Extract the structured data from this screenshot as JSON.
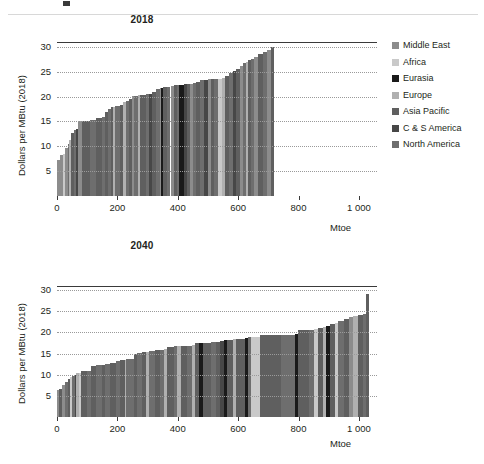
{
  "legend": {
    "position": "right",
    "items": [
      {
        "label": "Middle East",
        "color": "#8c8c8c"
      },
      {
        "label": "Africa",
        "color": "#c9c9c9"
      },
      {
        "label": "Eurasia",
        "color": "#1a1a1a"
      },
      {
        "label": "Europe",
        "color": "#b0b0b0"
      },
      {
        "label": "Asia Pacific",
        "color": "#5f5f5f"
      },
      {
        "label": "C & S America",
        "color": "#474747"
      },
      {
        "label": "North America",
        "color": "#6e6e6e"
      }
    ]
  },
  "chart_data": [
    {
      "type": "bar",
      "title": "2018",
      "xlabel": "Mtoe",
      "ylabel": "Dollars per MBtu (2018)",
      "xlim": [
        0,
        1060
      ],
      "ylim": [
        0,
        31
      ],
      "xticks": [
        0,
        200,
        400,
        600,
        800,
        1000
      ],
      "xticklabels": [
        "0",
        "200",
        "400",
        "600",
        "800",
        "1 000"
      ],
      "yticks": [
        5,
        10,
        15,
        20,
        25,
        30
      ],
      "yticklabels": [
        "5",
        "10",
        "15",
        "20",
        "25",
        "30"
      ],
      "grid": "horizontal-dotted",
      "orientation": "supply-curve-stepped",
      "bars": [
        {
          "x0": 0,
          "width": 10,
          "value": 7.2,
          "region": "Middle East"
        },
        {
          "x0": 10,
          "width": 9,
          "value": 8.3,
          "region": "Middle East"
        },
        {
          "x0": 19,
          "width": 7,
          "value": 8.5,
          "region": "Africa"
        },
        {
          "x0": 26,
          "width": 9,
          "value": 9.7,
          "region": "Middle East"
        },
        {
          "x0": 35,
          "width": 6,
          "value": 10.4,
          "region": "North America"
        },
        {
          "x0": 41,
          "width": 7,
          "value": 11.3,
          "region": "Europe"
        },
        {
          "x0": 48,
          "width": 8,
          "value": 12.6,
          "region": "Asia Pacific"
        },
        {
          "x0": 56,
          "width": 7,
          "value": 13.3,
          "region": "North America"
        },
        {
          "x0": 63,
          "width": 6,
          "value": 13.5,
          "region": "C & S America"
        },
        {
          "x0": 69,
          "width": 13,
          "value": 15.0,
          "region": "Middle East"
        },
        {
          "x0": 82,
          "width": 26,
          "value": 15.2,
          "region": "Asia Pacific"
        },
        {
          "x0": 108,
          "width": 22,
          "value": 15.4,
          "region": "North America"
        },
        {
          "x0": 130,
          "width": 20,
          "value": 15.7,
          "region": "Asia Pacific"
        },
        {
          "x0": 150,
          "width": 10,
          "value": 16.0,
          "region": "North America"
        },
        {
          "x0": 160,
          "width": 9,
          "value": 16.9,
          "region": "Asia Pacific"
        },
        {
          "x0": 169,
          "width": 10,
          "value": 17.6,
          "region": "North America"
        },
        {
          "x0": 179,
          "width": 8,
          "value": 17.9,
          "region": "Asia Pacific"
        },
        {
          "x0": 187,
          "width": 5,
          "value": 18.0,
          "region": "Europe"
        },
        {
          "x0": 192,
          "width": 16,
          "value": 18.1,
          "region": "North America"
        },
        {
          "x0": 208,
          "width": 10,
          "value": 18.3,
          "region": "Asia Pacific"
        },
        {
          "x0": 218,
          "width": 12,
          "value": 18.9,
          "region": "Europe"
        },
        {
          "x0": 230,
          "width": 10,
          "value": 19.2,
          "region": "North America"
        },
        {
          "x0": 240,
          "width": 8,
          "value": 19.6,
          "region": "Asia Pacific"
        },
        {
          "x0": 248,
          "width": 8,
          "value": 20.1,
          "region": "Middle East"
        },
        {
          "x0": 256,
          "width": 12,
          "value": 20.2,
          "region": "North America"
        },
        {
          "x0": 268,
          "width": 6,
          "value": 20.3,
          "region": "Europe"
        },
        {
          "x0": 274,
          "width": 20,
          "value": 20.4,
          "region": "Asia Pacific"
        },
        {
          "x0": 294,
          "width": 12,
          "value": 20.5,
          "region": "North America"
        },
        {
          "x0": 306,
          "width": 10,
          "value": 20.6,
          "region": "C & S America"
        },
        {
          "x0": 316,
          "width": 12,
          "value": 21.0,
          "region": "Asia Pacific"
        },
        {
          "x0": 328,
          "width": 12,
          "value": 21.5,
          "region": "North America"
        },
        {
          "x0": 340,
          "width": 5,
          "value": 21.7,
          "region": "Middle East"
        },
        {
          "x0": 345,
          "width": 5,
          "value": 21.8,
          "region": "Eurasia"
        },
        {
          "x0": 350,
          "width": 14,
          "value": 21.9,
          "region": "Asia Pacific"
        },
        {
          "x0": 364,
          "width": 12,
          "value": 22.0,
          "region": "North America"
        },
        {
          "x0": 376,
          "width": 10,
          "value": 22.1,
          "region": "Middle East"
        },
        {
          "x0": 386,
          "width": 10,
          "value": 22.3,
          "region": "Asia Pacific"
        },
        {
          "x0": 396,
          "width": 8,
          "value": 22.4,
          "region": "North America"
        },
        {
          "x0": 404,
          "width": 16,
          "value": 22.4,
          "region": "Eurasia"
        },
        {
          "x0": 420,
          "width": 10,
          "value": 22.5,
          "region": "C & S America"
        },
        {
          "x0": 430,
          "width": 12,
          "value": 22.6,
          "region": "Asia Pacific"
        },
        {
          "x0": 442,
          "width": 10,
          "value": 22.6,
          "region": "Middle East"
        },
        {
          "x0": 452,
          "width": 10,
          "value": 22.7,
          "region": "North America"
        },
        {
          "x0": 462,
          "width": 13,
          "value": 23.0,
          "region": "Asia Pacific"
        },
        {
          "x0": 475,
          "width": 12,
          "value": 23.3,
          "region": "North America"
        },
        {
          "x0": 487,
          "width": 12,
          "value": 23.4,
          "region": "C & S America"
        },
        {
          "x0": 499,
          "width": 12,
          "value": 23.5,
          "region": "Middle East"
        },
        {
          "x0": 511,
          "width": 10,
          "value": 23.5,
          "region": "Asia Pacific"
        },
        {
          "x0": 521,
          "width": 12,
          "value": 23.6,
          "region": "North America"
        },
        {
          "x0": 533,
          "width": 14,
          "value": 23.6,
          "region": "Africa"
        },
        {
          "x0": 547,
          "width": 10,
          "value": 23.7,
          "region": "Europe"
        },
        {
          "x0": 557,
          "width": 14,
          "value": 24.1,
          "region": "Asia Pacific"
        },
        {
          "x0": 571,
          "width": 12,
          "value": 24.7,
          "region": "North America"
        },
        {
          "x0": 583,
          "width": 10,
          "value": 25.1,
          "region": "C & S America"
        },
        {
          "x0": 593,
          "width": 12,
          "value": 25.6,
          "region": "Asia Pacific"
        },
        {
          "x0": 605,
          "width": 10,
          "value": 26.2,
          "region": "Middle East"
        },
        {
          "x0": 615,
          "width": 10,
          "value": 26.7,
          "region": "North America"
        },
        {
          "x0": 625,
          "width": 8,
          "value": 27.0,
          "region": "Europe"
        },
        {
          "x0": 633,
          "width": 10,
          "value": 27.3,
          "region": "Asia Pacific"
        },
        {
          "x0": 643,
          "width": 10,
          "value": 27.6,
          "region": "North America"
        },
        {
          "x0": 653,
          "width": 14,
          "value": 28.0,
          "region": "Middle East"
        },
        {
          "x0": 667,
          "width": 14,
          "value": 28.5,
          "region": "Asia Pacific"
        },
        {
          "x0": 681,
          "width": 14,
          "value": 29.0,
          "region": "North America"
        },
        {
          "x0": 695,
          "width": 14,
          "value": 29.3,
          "region": "Middle East"
        },
        {
          "x0": 709,
          "width": 11,
          "value": 29.9,
          "region": "Asia Pacific"
        }
      ]
    },
    {
      "type": "bar",
      "title": "2040",
      "xlabel": "Mtoe",
      "ylabel": "Dollars per MBtu (2018)",
      "xlim": [
        0,
        1060
      ],
      "ylim": [
        0,
        31
      ],
      "xticks": [
        0,
        200,
        400,
        600,
        800,
        1000
      ],
      "xticklabels": [
        "0",
        "200",
        "400",
        "600",
        "800",
        "1 000"
      ],
      "yticks": [
        5,
        10,
        15,
        20,
        25,
        30
      ],
      "yticklabels": [
        "5",
        "10",
        "15",
        "20",
        "25",
        "30"
      ],
      "grid": "horizontal-dotted",
      "orientation": "supply-curve-stepped",
      "bars": [
        {
          "x0": 0,
          "width": 8,
          "value": 6.3,
          "region": "Middle East"
        },
        {
          "x0": 8,
          "width": 10,
          "value": 6.7,
          "region": "Asia Pacific"
        },
        {
          "x0": 18,
          "width": 10,
          "value": 7.6,
          "region": "Middle East"
        },
        {
          "x0": 28,
          "width": 8,
          "value": 8.3,
          "region": "North America"
        },
        {
          "x0": 36,
          "width": 8,
          "value": 8.9,
          "region": "Asia Pacific"
        },
        {
          "x0": 44,
          "width": 6,
          "value": 9.4,
          "region": "Africa"
        },
        {
          "x0": 50,
          "width": 8,
          "value": 9.8,
          "region": "North America"
        },
        {
          "x0": 58,
          "width": 6,
          "value": 10.0,
          "region": "C & S America"
        },
        {
          "x0": 64,
          "width": 8,
          "value": 10.3,
          "region": "Europe"
        },
        {
          "x0": 72,
          "width": 6,
          "value": 10.5,
          "region": "Africa"
        },
        {
          "x0": 78,
          "width": 20,
          "value": 10.9,
          "region": "Asia Pacific"
        },
        {
          "x0": 98,
          "width": 14,
          "value": 11.0,
          "region": "North America"
        },
        {
          "x0": 112,
          "width": 18,
          "value": 12.1,
          "region": "Asia Pacific"
        },
        {
          "x0": 130,
          "width": 18,
          "value": 12.3,
          "region": "North America"
        },
        {
          "x0": 148,
          "width": 10,
          "value": 12.4,
          "region": "Asia Pacific"
        },
        {
          "x0": 158,
          "width": 16,
          "value": 12.5,
          "region": "North America"
        },
        {
          "x0": 174,
          "width": 20,
          "value": 12.7,
          "region": "Asia Pacific"
        },
        {
          "x0": 194,
          "width": 14,
          "value": 13.3,
          "region": "North America"
        },
        {
          "x0": 208,
          "width": 16,
          "value": 13.5,
          "region": "Asia Pacific"
        },
        {
          "x0": 224,
          "width": 6,
          "value": 13.6,
          "region": "Europe"
        },
        {
          "x0": 230,
          "width": 24,
          "value": 13.8,
          "region": "North America"
        },
        {
          "x0": 254,
          "width": 10,
          "value": 14.9,
          "region": "Asia Pacific"
        },
        {
          "x0": 264,
          "width": 16,
          "value": 15.1,
          "region": "North America"
        },
        {
          "x0": 280,
          "width": 14,
          "value": 15.3,
          "region": "Asia Pacific"
        },
        {
          "x0": 294,
          "width": 10,
          "value": 15.4,
          "region": "Europe"
        },
        {
          "x0": 304,
          "width": 20,
          "value": 15.7,
          "region": "North America"
        },
        {
          "x0": 324,
          "width": 18,
          "value": 15.8,
          "region": "Asia Pacific"
        },
        {
          "x0": 342,
          "width": 14,
          "value": 15.9,
          "region": "North America"
        },
        {
          "x0": 356,
          "width": 10,
          "value": 16.0,
          "region": "Europe"
        },
        {
          "x0": 366,
          "width": 22,
          "value": 16.6,
          "region": "Asia Pacific"
        },
        {
          "x0": 388,
          "width": 10,
          "value": 16.7,
          "region": "North America"
        },
        {
          "x0": 398,
          "width": 12,
          "value": 16.7,
          "region": "Europe"
        },
        {
          "x0": 410,
          "width": 20,
          "value": 16.8,
          "region": "Asia Pacific"
        },
        {
          "x0": 430,
          "width": 16,
          "value": 16.9,
          "region": "North America"
        },
        {
          "x0": 446,
          "width": 12,
          "value": 17.0,
          "region": "Europe"
        },
        {
          "x0": 458,
          "width": 14,
          "value": 17.4,
          "region": "Asia Pacific"
        },
        {
          "x0": 472,
          "width": 10,
          "value": 17.5,
          "region": "Eurasia"
        },
        {
          "x0": 482,
          "width": 28,
          "value": 17.6,
          "region": "Asia Pacific"
        },
        {
          "x0": 510,
          "width": 18,
          "value": 17.7,
          "region": "North America"
        },
        {
          "x0": 528,
          "width": 12,
          "value": 17.8,
          "region": "Asia Pacific"
        },
        {
          "x0": 540,
          "width": 12,
          "value": 17.9,
          "region": "C & S America"
        },
        {
          "x0": 552,
          "width": 12,
          "value": 18.2,
          "region": "Eurasia"
        },
        {
          "x0": 564,
          "width": 18,
          "value": 18.3,
          "region": "Asia Pacific"
        },
        {
          "x0": 582,
          "width": 10,
          "value": 18.4,
          "region": "Europe"
        },
        {
          "x0": 592,
          "width": 30,
          "value": 18.5,
          "region": "Asia Pacific"
        },
        {
          "x0": 622,
          "width": 10,
          "value": 18.6,
          "region": "Eurasia"
        },
        {
          "x0": 632,
          "width": 10,
          "value": 18.9,
          "region": "North America"
        },
        {
          "x0": 642,
          "width": 30,
          "value": 19.0,
          "region": "Africa"
        },
        {
          "x0": 672,
          "width": 70,
          "value": 19.4,
          "region": "Asia Pacific"
        },
        {
          "x0": 742,
          "width": 48,
          "value": 19.5,
          "region": "North America"
        },
        {
          "x0": 790,
          "width": 8,
          "value": 19.7,
          "region": "Eurasia"
        },
        {
          "x0": 798,
          "width": 36,
          "value": 20.6,
          "region": "Asia Pacific"
        },
        {
          "x0": 834,
          "width": 18,
          "value": 20.7,
          "region": "North America"
        },
        {
          "x0": 852,
          "width": 14,
          "value": 20.8,
          "region": "Africa"
        },
        {
          "x0": 866,
          "width": 16,
          "value": 21.0,
          "region": "Asia Pacific"
        },
        {
          "x0": 882,
          "width": 10,
          "value": 21.2,
          "region": "Europe"
        },
        {
          "x0": 892,
          "width": 12,
          "value": 21.5,
          "region": "Eurasia"
        },
        {
          "x0": 904,
          "width": 16,
          "value": 21.9,
          "region": "Asia Pacific"
        },
        {
          "x0": 920,
          "width": 12,
          "value": 22.2,
          "region": "Africa"
        },
        {
          "x0": 932,
          "width": 18,
          "value": 22.7,
          "region": "North America"
        },
        {
          "x0": 950,
          "width": 16,
          "value": 23.2,
          "region": "Asia Pacific"
        },
        {
          "x0": 966,
          "width": 14,
          "value": 23.6,
          "region": "Middle East"
        },
        {
          "x0": 980,
          "width": 16,
          "value": 23.8,
          "region": "Europe"
        },
        {
          "x0": 996,
          "width": 18,
          "value": 24.1,
          "region": "Asia Pacific"
        },
        {
          "x0": 1014,
          "width": 10,
          "value": 24.4,
          "region": "North America"
        },
        {
          "x0": 1024,
          "width": 8,
          "value": 29.0,
          "region": "Asia Pacific"
        }
      ]
    }
  ]
}
